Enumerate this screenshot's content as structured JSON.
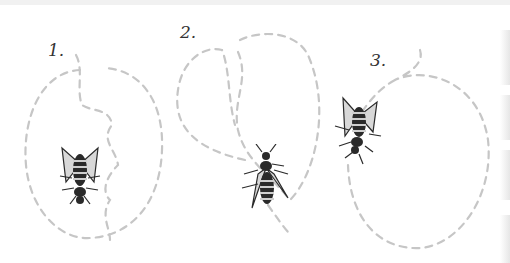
{
  "figure": {
    "labels": [
      "1.",
      "2.",
      "3."
    ],
    "path_color": "#c6c6c6",
    "bee_color": "#2a2a2a",
    "panels": [
      {
        "number": "1.",
        "path": "wavy inner line with large oval loop"
      },
      {
        "number": "2.",
        "path": "figure-eight double loop"
      },
      {
        "number": "3.",
        "path": "single large loop"
      }
    ]
  }
}
